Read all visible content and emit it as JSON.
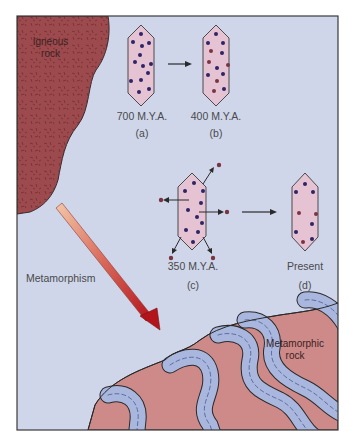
{
  "figure": {
    "colors": {
      "background": "#cfd6ea",
      "frame": "#3a3a3a",
      "igneous_rock": "#9c4a4d",
      "igneous_speckle": "#6e2a2e",
      "metamorphic_rock": "#cd8a89",
      "metamorphic_band": "#a9b7de",
      "crystal_fill": "#e6c3d2",
      "crystal_outline": "#4a4a4a",
      "parent_atom": "#2e2466",
      "daughter_atom": "#7a3340",
      "arrow_start": "#f4c6a8",
      "arrow_end": "#b3141c"
    },
    "igneous_label": [
      "Igneous",
      "rock"
    ],
    "metamorphic_label": [
      "Metamorphic",
      "rock"
    ],
    "process_label": "Metamorphism",
    "crystals": [
      {
        "id": "a",
        "age": "700 M.Y.A.",
        "tag": "(a)",
        "parent_atoms": 13,
        "daughter_atoms": 0
      },
      {
        "id": "b",
        "age": "400 M.Y.A.",
        "tag": "(b)",
        "parent_atoms": 8,
        "daughter_atoms": 5
      },
      {
        "id": "c",
        "age": "350 M.Y.A.",
        "tag": "(c)",
        "parent_atoms": 12,
        "daughter_atoms_expelled": 5
      },
      {
        "id": "d",
        "age": "Present",
        "tag": "(d)",
        "parent_atoms": 6,
        "daughter_atoms": 3
      }
    ]
  }
}
